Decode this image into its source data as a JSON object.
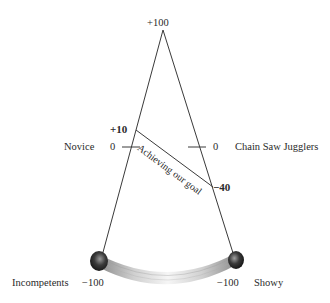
{
  "diagram": {
    "type": "pendulum-scale",
    "apex_label": "+100",
    "left_axis": {
      "name": "Novice",
      "zero_label": "0",
      "bottom_value": "−100",
      "bottom_name": "Incompetents"
    },
    "right_axis": {
      "name": "Chain Saw Jugglers",
      "zero_label": "0",
      "bottom_value": "−100",
      "bottom_name": "Showy"
    },
    "goal_line": {
      "label": "Achieving our goal",
      "start_value": "+10",
      "end_value": "−40"
    },
    "colors": {
      "line": "#3a3a3a",
      "ball_dark": "#1a1a1a",
      "swoosh": "#bdbdbd"
    }
  }
}
